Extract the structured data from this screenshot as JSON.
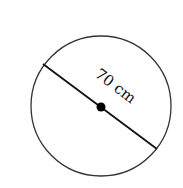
{
  "diagram": {
    "shape": "circle",
    "label": "70 cm",
    "measurement": "diameter",
    "value": 70,
    "unit": "cm",
    "colors": {
      "stroke": "#333333",
      "center_dot": "#000000",
      "background": "#ffffff"
    }
  }
}
